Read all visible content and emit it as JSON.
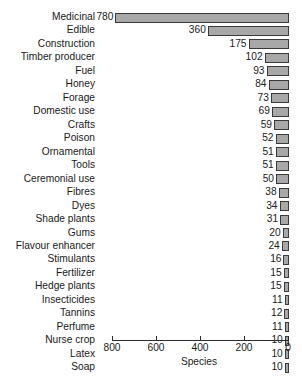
{
  "chart_data": {
    "type": "bar",
    "orientation": "horizontal",
    "title": "",
    "xlabel": "Species",
    "ylabel": "",
    "xlim": [
      800,
      0
    ],
    "x_axis_reversed": true,
    "grid": false,
    "legend": null,
    "bar_color": "#a8a8a8",
    "bar_edge_color": "#3a3a3a",
    "axis_color": "#2b2b2b",
    "text_color": "#1a1a1a",
    "background": "#ffffff",
    "xticks": [
      800,
      600,
      400,
      200,
      0
    ],
    "xtick_labels": [
      "800",
      "600",
      "400",
      "200",
      "0"
    ],
    "categories": [
      "Medicinal",
      "Edible",
      "Construction",
      "Timber producer",
      "Fuel",
      "Honey",
      "Forage",
      "Domestic use",
      "Crafts",
      "Poison",
      "Ornamental",
      "Tools",
      "Ceremonial use",
      "Fibres",
      "Dyes",
      "Shade plants",
      "Gums",
      "Flavour enhancer",
      "Stimulants",
      "Fertilizer",
      "Hedge plants",
      "Insecticides",
      "Tannins",
      "Perfume",
      "Nurse crop",
      "Latex",
      "Soap"
    ],
    "values": [
      780,
      360,
      175,
      102,
      93,
      84,
      73,
      69,
      59,
      52,
      51,
      51,
      50,
      38,
      34,
      31,
      20,
      24,
      16,
      15,
      15,
      11,
      12,
      11,
      10,
      10,
      10
    ],
    "value_labels": [
      "780",
      "360",
      "175",
      "102",
      "93",
      "84",
      "73",
      "69",
      "59",
      "52",
      "51",
      "51",
      "50",
      "38",
      "34",
      "31",
      "20",
      "24",
      "16",
      "15",
      "15",
      "11",
      "12",
      "11",
      "10",
      "10",
      "10"
    ]
  }
}
